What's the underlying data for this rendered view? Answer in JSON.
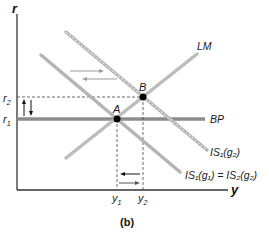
{
  "figure": {
    "caption": "(b)",
    "axes": {
      "x_label": "y",
      "y_label": "r"
    },
    "curves": {
      "lm": "LM",
      "bp": "BP",
      "is_shifted": "IS₁(g₂)",
      "is_original_main": "IS₁(g₁) = IS₂(g₂)"
    },
    "points": {
      "a": "A",
      "b": "B"
    },
    "ticks": {
      "r1": "r",
      "r1_sub": "1",
      "r2": "r",
      "r2_sub": "2",
      "y1": "y",
      "y1_sub": "1",
      "y2": "y",
      "y2_sub": "2"
    },
    "colors": {
      "curve": "#b8b8b8",
      "bp": "#8c8c8c",
      "axis": "#333333",
      "point": "#000000"
    }
  }
}
